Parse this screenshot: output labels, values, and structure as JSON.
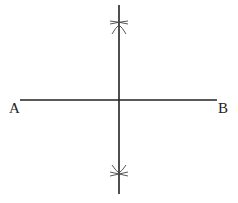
{
  "diagram": {
    "segment": {
      "start_label": "A",
      "end_label": "B",
      "start": [
        20,
        100
      ],
      "end": [
        217,
        100
      ]
    },
    "bisector": {
      "top": [
        119,
        5
      ],
      "bottom": [
        119,
        194
      ]
    },
    "arc_intersections": [
      {
        "position": "above",
        "point": [
          119,
          25
        ]
      },
      {
        "position": "below",
        "point": [
          119,
          173
        ]
      }
    ],
    "colors": {
      "line": "#222222",
      "arc": "#555555",
      "background": "#ffffff"
    }
  }
}
